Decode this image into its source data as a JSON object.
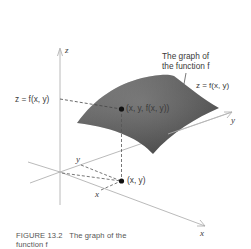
{
  "figure": {
    "caption_number": "FIGURE 13.2",
    "caption_text": "The graph of the function f",
    "caption_line1": "FIGURE 13.2   The graph of the",
    "caption_line2": "function f"
  },
  "labels": {
    "z_axis": "z",
    "y_axis": "y",
    "x_axis": "x",
    "graph_title_line1": "The graph of",
    "graph_title_line2": "the function f",
    "surface_equation": "z = f(x, y)",
    "height_label": "z = f(x, y)",
    "surface_point": "(x, y, f(x, y))",
    "domain_point": "(x, y)",
    "y_coord_tick": "y",
    "x_coord_tick": "x"
  },
  "colors": {
    "surface_dark": "#555555",
    "surface_light": "#9a9a9a",
    "axis": "#9a9a9a",
    "dashed": "#555555",
    "point": "#111111",
    "text": "#3a3a3a"
  }
}
